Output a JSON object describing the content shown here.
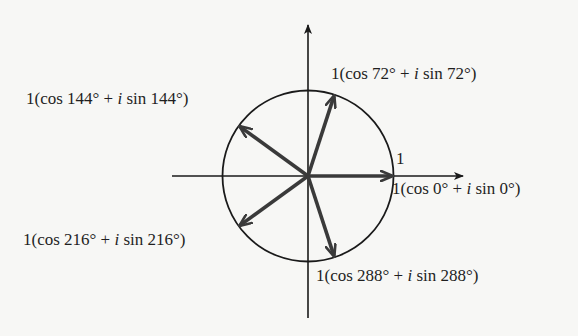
{
  "figure": {
    "type": "complex-roots-of-unity",
    "radius_label": "1",
    "axes": {
      "horizontal": "real-axis",
      "vertical": "imaginary-axis"
    },
    "vectors": [
      {
        "angle_deg": 0,
        "label_prefix": "1(cos 0° + ",
        "label_i": "i",
        "label_suffix": " sin 0°)"
      },
      {
        "angle_deg": 72,
        "label_prefix": "1(cos 72° + ",
        "label_i": "i",
        "label_suffix": " sin 72°)"
      },
      {
        "angle_deg": 144,
        "label_prefix": "1(cos 144° + ",
        "label_i": "i",
        "label_suffix": " sin 144°)"
      },
      {
        "angle_deg": 216,
        "label_prefix": "1(cos 216° + ",
        "label_i": "i",
        "label_suffix": " sin 216°)"
      },
      {
        "angle_deg": 288,
        "label_prefix": "1(cos 288° + ",
        "label_i": "i",
        "label_suffix": " sin 288°)"
      }
    ],
    "colors": {
      "axis": "#1a1a1a",
      "circle": "#1a1a1a",
      "vector": "#3a3a3a",
      "background": "#f7f7f5"
    }
  }
}
